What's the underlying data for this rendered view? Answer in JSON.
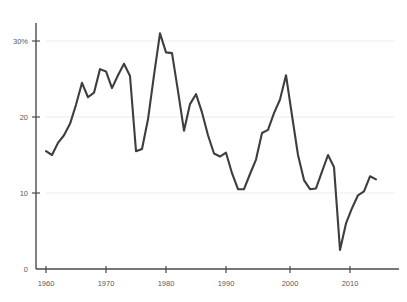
{
  "chart_data": {
    "type": "line",
    "title": "",
    "subtitle": "",
    "xlabel": "",
    "ylabel": "",
    "xlim": [
      1959.2,
      2015.8
    ],
    "ylim": [
      0,
      32
    ],
    "grid": "horizontal",
    "legend": "none",
    "axis_color": "#4a4a4a",
    "grid_color": "#e8e8e8",
    "line_color": "#3e3e3e",
    "line_width": 2.1,
    "x_ticks": [
      1960,
      1970,
      1980,
      1990,
      2000,
      2010
    ],
    "x_tick_labels": [
      "1960",
      "1970",
      "1980",
      "1990",
      "2000",
      "2010"
    ],
    "y_ticks": [
      0,
      10,
      20,
      30
    ],
    "y_tick_labels": [
      "0",
      "10",
      "20",
      "30%"
    ],
    "series": [
      {
        "name": "value",
        "x": [
          1960,
          1961,
          1962,
          1963,
          1964,
          1965,
          1966,
          1967,
          1968,
          1969,
          1970,
          1971,
          1972,
          1973,
          1974,
          1975,
          1976,
          1977,
          1978,
          1979,
          1980,
          1981,
          1982,
          1983,
          1984,
          1985,
          1986,
          1987,
          1988,
          1989,
          1990,
          1991,
          1992,
          1993,
          1994,
          1995,
          1996,
          1997,
          1998,
          1999,
          2000,
          2001,
          2002,
          2003,
          2004,
          2005,
          2006,
          2007,
          2008,
          2009,
          2010,
          2011,
          2012,
          2013,
          2014,
          2015
        ],
        "values": [
          15.5,
          15.0,
          16.6,
          17.6,
          19.1,
          21.6,
          24.5,
          22.6,
          23.2,
          26.3,
          26.0,
          23.8,
          25.5,
          27.0,
          25.4,
          15.5,
          15.8,
          19.7,
          25.5,
          31.0,
          28.5,
          28.4,
          23.4,
          18.2,
          21.7,
          23.0,
          20.6,
          17.6,
          15.2,
          14.8,
          15.3,
          12.6,
          10.5,
          10.5,
          12.5,
          14.4,
          17.9,
          18.3,
          20.5,
          22.3,
          25.5,
          20.2,
          15.0,
          11.7,
          10.5,
          10.6,
          12.8,
          15.0,
          13.4,
          2.5,
          6.0,
          8.0,
          9.7,
          10.2,
          12.2,
          11.8
        ]
      }
    ]
  }
}
